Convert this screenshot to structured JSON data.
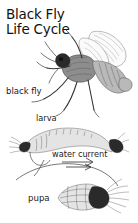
{
  "figure": {
    "title_line1": "Black Fly",
    "title_line2": "Life Cycle",
    "labels": {
      "adult": "black fly",
      "larva": "larva",
      "water_current": "water current",
      "pupa": "pupa"
    },
    "colors": {
      "background": "#ffffff",
      "ink": "#2b2b2b",
      "text": "#1a1a1a"
    },
    "illustrations": [
      {
        "name": "adult-black-fly",
        "stage": "adult"
      },
      {
        "name": "larva-on-substrate",
        "stage": "larva"
      },
      {
        "name": "current-arrow",
        "stage": "larva"
      },
      {
        "name": "pupa-in-cocoon",
        "stage": "pupa"
      }
    ]
  }
}
